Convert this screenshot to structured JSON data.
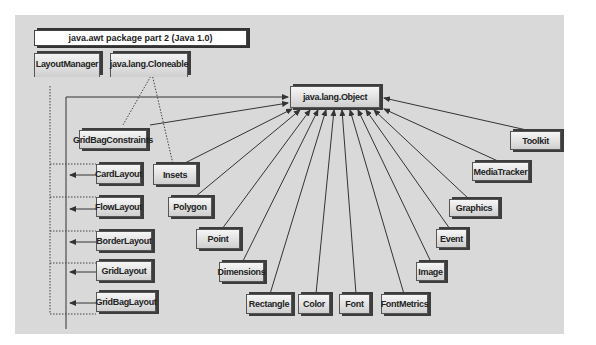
{
  "diagram": {
    "title": "java.awt package part 2 (Java 1.0)",
    "interfaces": [
      {
        "id": "layoutmanager",
        "label": "LayoutManager"
      },
      {
        "id": "cloneable",
        "label": "java.lang.Cloneable"
      }
    ],
    "root": {
      "id": "object",
      "label": "java.lang.Object"
    },
    "classes": [
      {
        "id": "gridbagconstraints",
        "label": "GridBagConstraints"
      },
      {
        "id": "insets",
        "label": "Insets"
      },
      {
        "id": "polygon",
        "label": "Polygon"
      },
      {
        "id": "point",
        "label": "Point"
      },
      {
        "id": "dimensions",
        "label": "Dimensions"
      },
      {
        "id": "rectangle",
        "label": "Rectangle"
      },
      {
        "id": "color",
        "label": "Color"
      },
      {
        "id": "font",
        "label": "Font"
      },
      {
        "id": "fontmetrics",
        "label": "FontMetrics"
      },
      {
        "id": "image",
        "label": "Image"
      },
      {
        "id": "event",
        "label": "Event"
      },
      {
        "id": "graphics",
        "label": "Graphics"
      },
      {
        "id": "mediatracker",
        "label": "MediaTracker"
      },
      {
        "id": "toolkit",
        "label": "Toolkit"
      },
      {
        "id": "cardlayout",
        "label": "CardLayout"
      },
      {
        "id": "flowlayout",
        "label": "FlowLayout"
      },
      {
        "id": "borderlayout",
        "label": "BorderLayout"
      },
      {
        "id": "gridlayout",
        "label": "GridLayout"
      },
      {
        "id": "gridbaglayout",
        "label": "GridBagLayout"
      }
    ],
    "edges": {
      "extends_object": [
        "gridbagconstraints",
        "insets",
        "polygon",
        "point",
        "dimensions",
        "rectangle",
        "color",
        "font",
        "fontmetrics",
        "image",
        "event",
        "graphics",
        "mediatracker",
        "toolkit",
        "cardlayout",
        "flowlayout",
        "borderlayout",
        "gridlayout",
        "gridbaglayout"
      ],
      "implements_layoutmanager": [
        "cardlayout",
        "flowlayout",
        "borderlayout",
        "gridlayout",
        "gridbaglayout"
      ],
      "implements_cloneable": [
        "gridbagconstraints",
        "insets"
      ]
    }
  }
}
